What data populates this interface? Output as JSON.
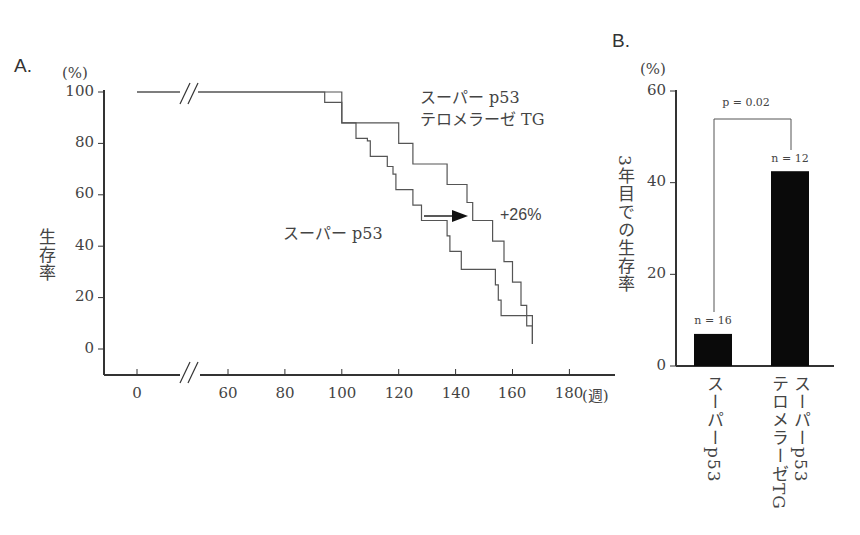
{
  "chart_data": [
    {
      "panel": "A.",
      "type": "line",
      "subtype": "kaplan-meier step",
      "y_unit": "(%)",
      "ylabel": "生存率",
      "xlabel": "(週)",
      "ylim": [
        0,
        100
      ],
      "y_ticks": [
        "100",
        "80",
        "60",
        "40",
        "20",
        "0"
      ],
      "x_ticks": [
        "0",
        "60",
        "80",
        "100",
        "120",
        "140",
        "160",
        "180"
      ],
      "axis_break": true,
      "series": [
        {
          "name": "スーパー p53 テロメラーゼ TG",
          "label_line1": "スーパー p53",
          "label_line2": "テロメラーゼ TG",
          "points": [
            [
              0,
              100
            ],
            [
              100,
              100
            ],
            [
              100,
              88
            ],
            [
              120,
              88
            ],
            [
              120,
              80
            ],
            [
              125,
              80
            ],
            [
              125,
              72
            ],
            [
              137,
              72
            ],
            [
              137,
              64
            ],
            [
              144,
              64
            ],
            [
              144,
              57
            ],
            [
              146,
              57
            ],
            [
              146,
              50
            ],
            [
              153,
              50
            ],
            [
              153,
              42
            ],
            [
              157,
              42
            ],
            [
              157,
              34
            ],
            [
              160,
              34
            ],
            [
              160,
              26
            ],
            [
              163,
              26
            ],
            [
              163,
              17
            ],
            [
              165,
              17
            ],
            [
              165,
              9
            ],
            [
              167,
              9
            ],
            [
              167,
              2
            ]
          ]
        },
        {
          "name": "スーパー p53",
          "label": "スーパー p53",
          "points": [
            [
              0,
              100
            ],
            [
              94,
              100
            ],
            [
              94,
              96
            ],
            [
              100,
              96
            ],
            [
              100,
              88
            ],
            [
              105,
              88
            ],
            [
              105,
              82
            ],
            [
              109,
              82
            ],
            [
              109,
              81
            ],
            [
              110,
              81
            ],
            [
              110,
              75
            ],
            [
              116,
              75
            ],
            [
              116,
              71
            ],
            [
              118,
              71
            ],
            [
              118,
              68
            ],
            [
              119,
              68
            ],
            [
              119,
              62
            ],
            [
              125,
              62
            ],
            [
              125,
              56
            ],
            [
              128,
              56
            ],
            [
              128,
              50
            ],
            [
              137,
              50
            ],
            [
              137,
              44
            ],
            [
              138,
              44
            ],
            [
              138,
              38
            ],
            [
              142,
              38
            ],
            [
              142,
              31
            ],
            [
              154,
              31
            ],
            [
              154,
              25
            ],
            [
              155,
              25
            ],
            [
              155,
              19
            ],
            [
              156,
              19
            ],
            [
              156,
              13
            ],
            [
              167,
              13
            ],
            [
              167,
              2
            ]
          ]
        }
      ],
      "annotation": {
        "arrow": true,
        "text": "+26%"
      }
    },
    {
      "panel": "B.",
      "type": "bar",
      "y_unit": "(%)",
      "ylabel": "3年目での生存率",
      "ylim": [
        0,
        60
      ],
      "y_ticks": [
        "60",
        "40",
        "20",
        "0"
      ],
      "categories": [
        "スーパーp53",
        "スーパーp53 テロメラーゼTG"
      ],
      "category_lines": [
        [
          "スーパーp53"
        ],
        [
          "スーパーp53",
          "テロメラーゼTG"
        ]
      ],
      "values": [
        7,
        42.5
      ],
      "n_labels": [
        "n = 16",
        "n = 12"
      ],
      "significance": "p = 0.02"
    }
  ]
}
